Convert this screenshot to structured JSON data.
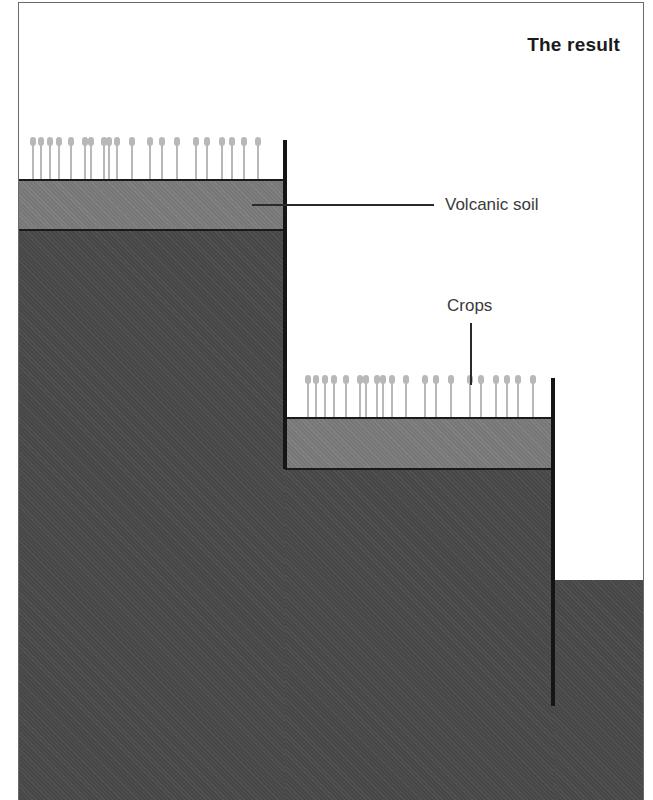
{
  "title": "The result",
  "labels": {
    "volcanic_soil": "Volcanic soil",
    "crops": "Crops"
  },
  "colors": {
    "ground": "#4b4b4b",
    "soil": "#7c7c7c",
    "wall": "#151515",
    "crop": "#b8b8b8",
    "background": "#ffffff"
  },
  "terraces": [
    {
      "name": "upper-terrace",
      "crop_x": [
        33,
        41,
        50,
        59,
        71,
        85,
        91,
        104,
        109,
        117,
        132,
        150,
        162,
        177,
        196,
        207,
        222,
        232,
        244,
        258
      ],
      "crop_top": 140,
      "soil_top": 179,
      "soil_bottom": 231,
      "wall_x": 283,
      "wall_top": 140,
      "wall_bottom": 469
    },
    {
      "name": "lower-terrace",
      "crop_x": [
        308,
        316,
        325,
        334,
        346,
        360,
        366,
        377,
        383,
        392,
        406,
        425,
        436,
        451,
        470,
        481,
        496,
        507,
        518,
        533
      ],
      "crop_top": 378,
      "soil_top": 417,
      "soil_bottom": 470,
      "wall_x": 551,
      "wall_top": 378,
      "wall_bottom": 706
    }
  ]
}
